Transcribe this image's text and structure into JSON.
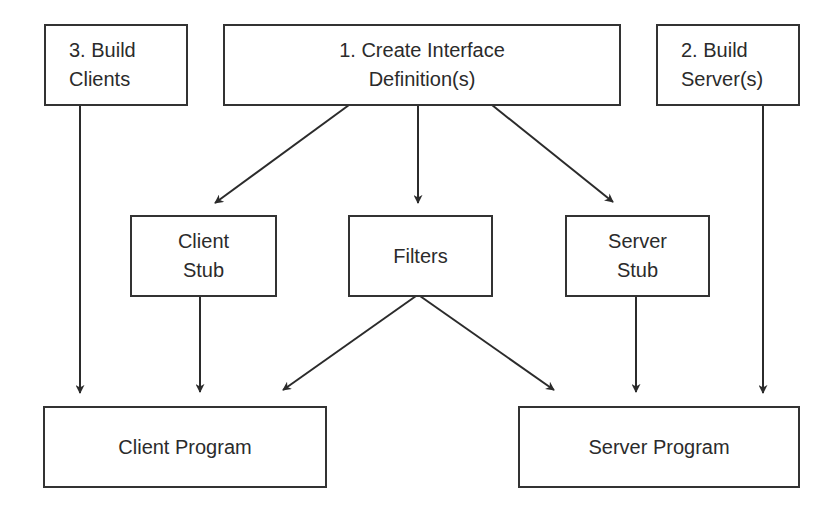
{
  "diagram": {
    "nodes": [
      {
        "id": "build-clients",
        "label": "3. Build\nClients"
      },
      {
        "id": "create-idl",
        "label": "1. Create Interface\nDefinition(s)"
      },
      {
        "id": "build-servers",
        "label": "2. Build\nServer(s)"
      },
      {
        "id": "client-stub",
        "label": "Client\nStub"
      },
      {
        "id": "filters",
        "label": "Filters"
      },
      {
        "id": "server-stub",
        "label": "Server\nStub"
      },
      {
        "id": "client-program",
        "label": "Client Program"
      },
      {
        "id": "server-program",
        "label": "Server Program"
      }
    ],
    "edges": [
      {
        "from": "create-idl",
        "to": "client-stub"
      },
      {
        "from": "create-idl",
        "to": "filters"
      },
      {
        "from": "create-idl",
        "to": "server-stub"
      },
      {
        "from": "build-clients",
        "to": "client-program"
      },
      {
        "from": "client-stub",
        "to": "client-program"
      },
      {
        "from": "filters",
        "to": "client-program"
      },
      {
        "from": "filters",
        "to": "server-program"
      },
      {
        "from": "server-stub",
        "to": "server-program"
      },
      {
        "from": "build-servers",
        "to": "server-program"
      }
    ]
  }
}
